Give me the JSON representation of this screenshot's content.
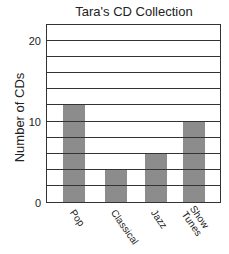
{
  "chart_data": {
    "type": "bar",
    "title": "Tara's CD Collection",
    "xlabel": "",
    "ylabel": "Number of CDs",
    "categories": [
      "Pop",
      "Classical",
      "Jazz",
      "Show Tunes"
    ],
    "values": [
      12,
      4,
      6,
      10
    ],
    "ylim": [
      0,
      22
    ],
    "yticks": [
      0,
      10,
      20
    ],
    "grid_step": 2,
    "grid": true,
    "bar_color": "#8c8c8c",
    "legend": null
  },
  "labels": {
    "title": "Tara's CD Collection",
    "ylabel": "Number of CDs",
    "ytick_0": "0",
    "ytick_10": "10",
    "ytick_20": "20",
    "x_pop": "Pop",
    "x_classical": "Classical",
    "x_jazz": "Jazz",
    "x_showtunes": "Show\nTunes"
  }
}
